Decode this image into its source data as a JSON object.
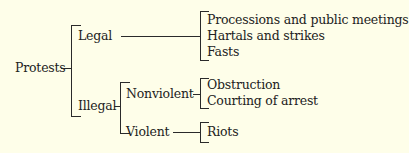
{
  "diagram": {
    "root": {
      "label": "Protests"
    },
    "branches": [
      {
        "label": "Legal",
        "items": [
          "Processions and public meetings",
          "Hartals and strikes",
          "Fasts"
        ]
      },
      {
        "label": "Illegal",
        "sub": [
          {
            "label": "Nonviolent",
            "items": [
              "Obstruction",
              "Courting of arrest"
            ]
          },
          {
            "label": "Violent",
            "items": [
              "Riots"
            ]
          }
        ]
      }
    ]
  }
}
